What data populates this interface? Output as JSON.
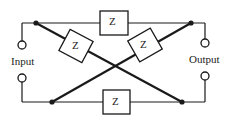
{
  "diagram": {
    "input_label": "Input",
    "output_label": "Output",
    "impedances": [
      {
        "id": "top",
        "label": "Z"
      },
      {
        "id": "diag-left",
        "label": "Z"
      },
      {
        "id": "diag-right",
        "label": "Z"
      },
      {
        "id": "bottom",
        "label": "Z"
      }
    ],
    "colors": {
      "line": "#1a1a1a",
      "background": "#ffffff"
    }
  }
}
